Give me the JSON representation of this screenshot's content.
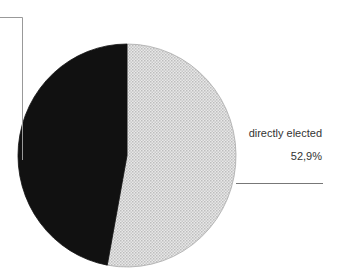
{
  "chart_data": {
    "type": "pie",
    "title": "",
    "slices": [
      {
        "label": "directly elected",
        "value": 52.9,
        "display": "52,9%",
        "color": "#d9d9d9",
        "pattern": "dotted"
      },
      {
        "label": "",
        "value": 47.1,
        "display": "",
        "color": "#111111"
      }
    ],
    "start_angle_deg": 0,
    "direction": "clockwise"
  },
  "labels": {
    "slice1_name": "directly elected",
    "slice1_value": "52,9%"
  }
}
